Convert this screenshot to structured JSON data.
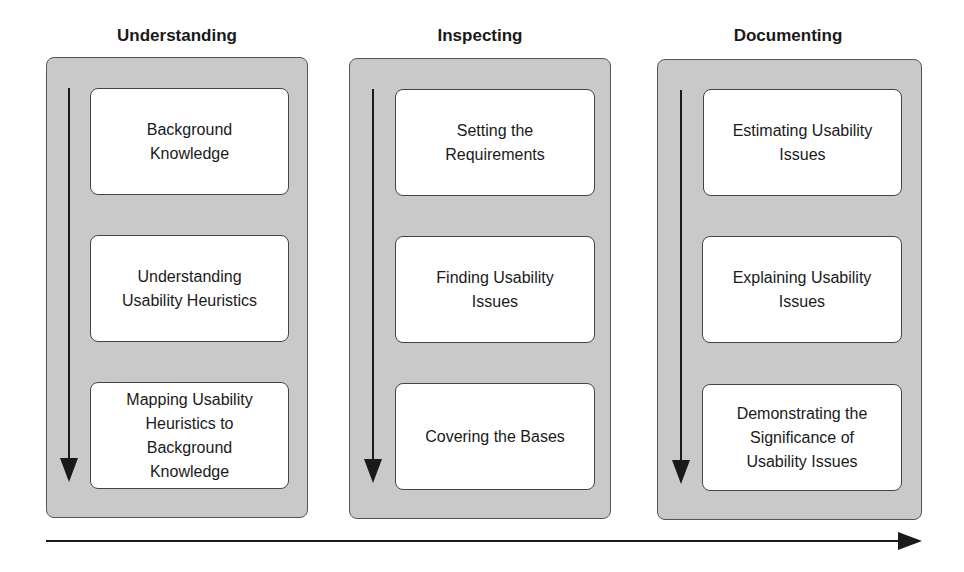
{
  "columns": [
    {
      "title": "Understanding",
      "steps": [
        "Background\nKnowledge",
        "Understanding\nUsability Heuristics",
        "Mapping Usability\nHeuristics to\nBackground\nKnowledge"
      ]
    },
    {
      "title": "Inspecting",
      "steps": [
        "Setting the\nRequirements",
        "Finding Usability\nIssues",
        "Covering the Bases"
      ]
    },
    {
      "title": "Documenting",
      "steps": [
        "Estimating Usability\nIssues",
        "Explaining Usability\nIssues",
        "Demonstrating the\nSignificance of\nUsability Issues"
      ]
    }
  ],
  "colors": {
    "panel_fill": "#c9c9c9",
    "box_fill": "#ffffff",
    "stroke": "#1a1a1a"
  }
}
